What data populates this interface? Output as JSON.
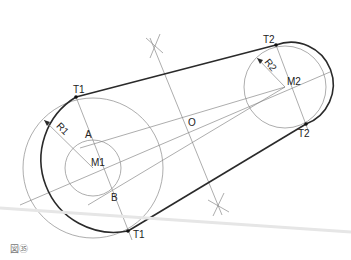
{
  "diagram": {
    "type": "geometric-construction",
    "labels": {
      "t1_top": "T1",
      "t1_bottom": "T1",
      "t2_top": "T2",
      "t2_bottom": "T2",
      "r1": "R1",
      "r2": "R2",
      "m1": "M1",
      "m2": "M2",
      "a": "A",
      "b": "B",
      "o": "O"
    },
    "points": {
      "M1": [
        93,
        168
      ],
      "M2": [
        285,
        87
      ],
      "O": [
        192,
        121
      ],
      "T1_top": [
        76,
        97
      ],
      "T1_bottom": [
        128,
        231
      ],
      "T2_top": [
        276,
        45
      ],
      "T2_bottom": [
        306,
        124
      ],
      "A": [
        88,
        142
      ],
      "B": [
        108,
        195
      ]
    },
    "circles": {
      "small_m1_radius": 28,
      "construction_m1_radius": 70,
      "r1_radius": 73,
      "r2_radius": 41
    },
    "colors": {
      "outline": "#2a2a2a",
      "construction": "#8a8a8a"
    }
  },
  "caption": "図㉟"
}
